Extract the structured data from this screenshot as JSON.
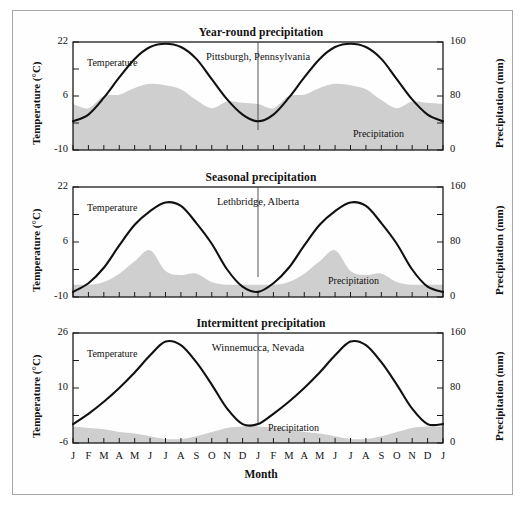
{
  "figure": {
    "x_axis_title": "Month",
    "month_labels": [
      "J",
      "F",
      "M",
      "A",
      "M",
      "J",
      "J",
      "A",
      "S",
      "O",
      "N",
      "D",
      "J",
      "F",
      "M",
      "A",
      "M",
      "J",
      "J",
      "A",
      "S",
      "O",
      "N",
      "D",
      "J"
    ],
    "axis_title_left": "Temperature (°C)",
    "axis_title_right": "Precipitation (mm)",
    "temperature_series_label": "Temperature",
    "precipitation_series_label": "Precipitation",
    "colors": {
      "precipitation_fill": "#cfcfcf",
      "temperature_line": "#111111",
      "axis": "#1a1a1a",
      "frame": "#a8a8a8",
      "background": "#ffffff"
    }
  },
  "chart_data": [
    {
      "type": "area",
      "panel_index": 0,
      "title": "Year-round precipitation",
      "place": "Pittsburgh, Pennsylvania",
      "xlabel": "Month",
      "ylabel": "Temperature (°C)",
      "y2label": "Precipitation (mm)",
      "ylim": [
        -10,
        22
      ],
      "ytick_labels": [
        "22",
        "6",
        "-10"
      ],
      "yticks": [
        22,
        6,
        -10
      ],
      "y2lim": [
        0,
        160
      ],
      "y2tick_labels": [
        "160",
        "80",
        "0"
      ],
      "y2ticks": [
        160,
        80,
        0
      ],
      "categories": [
        "J",
        "F",
        "M",
        "A",
        "M",
        "J",
        "J",
        "A",
        "S",
        "O",
        "N",
        "D"
      ],
      "grid": false,
      "legend": "inline-annotations",
      "series": [
        {
          "name": "Temperature",
          "unit": "°C",
          "axis": "left",
          "values": [
            -1.5,
            0.5,
            5.5,
            11.5,
            17.0,
            20.5,
            21.5,
            20.5,
            17.0,
            11.0,
            5.0,
            0.5
          ]
        },
        {
          "name": "Precipitation",
          "unit": "mm",
          "axis": "right",
          "values": [
            68,
            62,
            80,
            82,
            92,
            98,
            96,
            90,
            74,
            62,
            72,
            70
          ]
        }
      ]
    },
    {
      "type": "area",
      "panel_index": 1,
      "title": "Seasonal precipitation",
      "place": "Lethbridge, Alberta",
      "xlabel": "Month",
      "ylabel": "Temperature (°C)",
      "y2label": "Precipitation (mm)",
      "ylim": [
        -10,
        22
      ],
      "ytick_labels": [
        "22",
        "6",
        "-10"
      ],
      "yticks": [
        22,
        6,
        -10
      ],
      "y2lim": [
        0,
        160
      ],
      "y2tick_labels": [
        "160",
        "80",
        "0"
      ],
      "y2ticks": [
        160,
        80,
        0
      ],
      "categories": [
        "J",
        "F",
        "M",
        "A",
        "M",
        "J",
        "J",
        "A",
        "S",
        "O",
        "N",
        "D"
      ],
      "grid": false,
      "legend": "inline-annotations",
      "series": [
        {
          "name": "Temperature",
          "unit": "°C",
          "axis": "left",
          "values": [
            -8.5,
            -6.0,
            -1.5,
            5.0,
            11.0,
            15.0,
            17.5,
            16.5,
            11.5,
            5.5,
            -2.0,
            -7.0
          ]
        },
        {
          "name": "Precipitation",
          "unit": "mm",
          "axis": "right",
          "values": [
            18,
            18,
            22,
            34,
            52,
            68,
            38,
            32,
            34,
            22,
            18,
            18
          ]
        }
      ]
    },
    {
      "type": "area",
      "panel_index": 2,
      "title": "Intermittent precipitation",
      "place": "Winnemucca, Nevada",
      "xlabel": "Month",
      "ylabel": "Temperature (°C)",
      "y2label": "Precipitation (mm)",
      "ylim": [
        -6,
        26
      ],
      "ytick_labels": [
        "26",
        "10",
        "-6"
      ],
      "yticks": [
        26,
        10,
        -6
      ],
      "y2lim": [
        0,
        160
      ],
      "y2tick_labels": [
        "160",
        "80",
        "0"
      ],
      "y2ticks": [
        160,
        80,
        0
      ],
      "categories": [
        "J",
        "F",
        "M",
        "A",
        "M",
        "J",
        "J",
        "A",
        "S",
        "O",
        "N",
        "D"
      ],
      "grid": false,
      "legend": "inline-annotations",
      "series": [
        {
          "name": "Temperature",
          "unit": "°C",
          "axis": "left",
          "values": [
            -0.5,
            2.5,
            6.0,
            10.0,
            14.5,
            19.5,
            23.5,
            22.5,
            17.5,
            11.0,
            4.0,
            -0.5
          ]
        },
        {
          "name": "Precipitation",
          "unit": "mm",
          "axis": "right",
          "values": [
            24,
            22,
            20,
            16,
            14,
            10,
            6,
            6,
            10,
            16,
            22,
            24
          ]
        }
      ]
    }
  ]
}
